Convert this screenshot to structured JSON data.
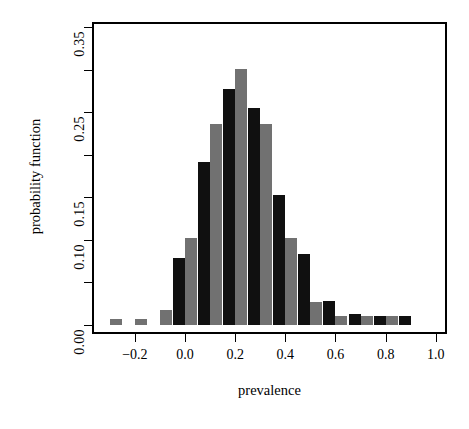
{
  "figure": {
    "width": 469,
    "height": 429,
    "background": "#ffffff",
    "frame_color": "#000000"
  },
  "colors": {
    "series_black": "#101010",
    "series_gray": "#717171",
    "axis": "#000000",
    "text": "#000000"
  },
  "chart_data": {
    "type": "bar",
    "title": "",
    "subtitle": "",
    "xlabel": "prevalence",
    "ylabel": "probability function",
    "xlim": [
      -0.33,
      1.06
    ],
    "ylim": [
      0.0,
      0.366
    ],
    "grid": false,
    "legend": null,
    "bar_width": 0.048,
    "group_pitch": 0.1,
    "x_ticks": [
      -0.2,
      0.0,
      0.2,
      0.4,
      0.6,
      0.8,
      1.0
    ],
    "x_tick_labels": [
      "-0.2",
      "0.0",
      "0.2",
      "0.4",
      "0.6",
      "0.8",
      "1.0"
    ],
    "y_ticks": [
      0.0,
      0.05,
      0.1,
      0.15,
      0.2,
      0.25,
      0.3,
      0.35
    ],
    "y_tick_labels": [
      "0.00",
      "",
      "0.10",
      "0.15",
      "",
      "0.25",
      "",
      "0.35"
    ],
    "y_labeled_ticks": [
      0.0,
      0.1,
      0.15,
      0.25,
      0.35
    ],
    "categories": [
      -0.3,
      -0.2,
      -0.1,
      0.0,
      0.1,
      0.2,
      0.3,
      0.4,
      0.5,
      0.6,
      0.7,
      0.8,
      0.9
    ],
    "series": [
      {
        "name": "black",
        "color": "#101010",
        "values": [
          0.0,
          0.0,
          0.0,
          0.079,
          0.191,
          0.277,
          0.255,
          0.153,
          0.083,
          0.028,
          0.013,
          0.01,
          0.01
        ]
      },
      {
        "name": "gray",
        "color": "#717171",
        "values": [
          0.007,
          0.007,
          0.018,
          0.102,
          0.236,
          0.301,
          0.236,
          0.102,
          0.027,
          0.011,
          0.01,
          0.01,
          0.0
        ]
      }
    ],
    "bars": [
      {
        "x": -0.3,
        "series": "gray",
        "value": 0.007
      },
      {
        "x": -0.2,
        "series": "gray",
        "value": 0.007
      },
      {
        "x": -0.1,
        "series": "gray",
        "value": 0.018
      },
      {
        "x": 0.0,
        "series": "black",
        "value": 0.079
      },
      {
        "x": 0.0,
        "series": "gray",
        "value": 0.102
      },
      {
        "x": 0.1,
        "series": "black",
        "value": 0.191
      },
      {
        "x": 0.1,
        "series": "gray",
        "value": 0.236
      },
      {
        "x": 0.2,
        "series": "black",
        "value": 0.277
      },
      {
        "x": 0.2,
        "series": "gray",
        "value": 0.301
      },
      {
        "x": 0.3,
        "series": "black",
        "value": 0.255
      },
      {
        "x": 0.3,
        "series": "gray",
        "value": 0.236
      },
      {
        "x": 0.4,
        "series": "black",
        "value": 0.153
      },
      {
        "x": 0.4,
        "series": "gray",
        "value": 0.102
      },
      {
        "x": 0.5,
        "series": "black",
        "value": 0.083
      },
      {
        "x": 0.5,
        "series": "gray",
        "value": 0.027
      },
      {
        "x": 0.6,
        "series": "black",
        "value": 0.028
      },
      {
        "x": 0.6,
        "series": "gray",
        "value": 0.011
      },
      {
        "x": 0.7,
        "series": "black",
        "value": 0.013
      },
      {
        "x": 0.7,
        "series": "gray",
        "value": 0.01
      },
      {
        "x": 0.8,
        "series": "black",
        "value": 0.01
      },
      {
        "x": 0.8,
        "series": "gray",
        "value": 0.01
      },
      {
        "x": 0.9,
        "series": "black",
        "value": 0.01
      }
    ]
  },
  "geometry": {
    "plot_left": 92,
    "plot_top": 22,
    "plot_right": 447,
    "plot_bottom": 334,
    "x_zero_px": 185,
    "x_scale_px_per_unit": 250.8,
    "y_zero_px": 325,
    "y_scale_px_per_unit": 851,
    "bar_px_width": 12
  }
}
